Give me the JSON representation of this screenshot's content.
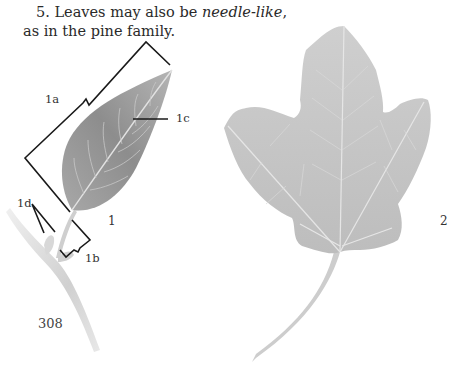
{
  "text": {
    "item_number": "5.",
    "sentence_start": "Leaves may also be ",
    "term": "needle-like",
    "sentence_end_line1": ",",
    "sentence_line2": "as in the pine family."
  },
  "figure1": {
    "number": "1",
    "labels": {
      "a": "1a",
      "b": "1b",
      "c": "1c",
      "d": "1d"
    }
  },
  "figure2": {
    "number": "2"
  },
  "page_number": "308",
  "colors": {
    "leaf1": "#8a8a8a",
    "leaf2": "#c2c2c2",
    "bracket": "#1a1a1a",
    "text": "#2a2a2a"
  }
}
